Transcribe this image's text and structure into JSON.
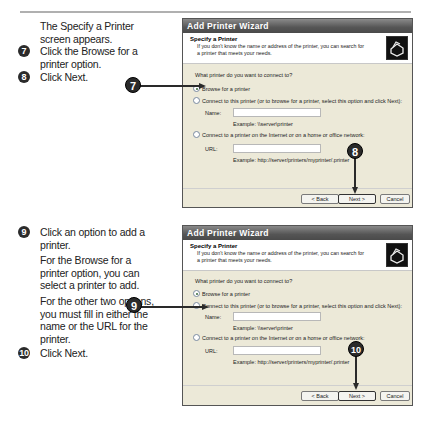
{
  "steps_top": {
    "intro": "The Specify a Printer screen appears.",
    "items": [
      {
        "num": "7",
        "text": "Click the Browse for a printer option."
      },
      {
        "num": "8",
        "text": "Click Next."
      }
    ]
  },
  "steps_bottom": {
    "items": [
      {
        "num": "9",
        "text": "Click an option to add a printer."
      },
      {
        "num": "",
        "text": "For the Browse for a printer option, you can select a printer to add."
      },
      {
        "num": "",
        "text": "For the other two options, you must fill in either the name or the URL for the printer."
      },
      {
        "num": "10",
        "text": "Click Next."
      }
    ]
  },
  "dialog": {
    "title": "Add Printer Wizard",
    "header_title": "Specify a Printer",
    "header_desc": "If you don't know the name or address of the printer, you can search for a printer that meets your needs.",
    "question": "What printer do you want to connect to?",
    "options": [
      "Browse for a printer",
      "Connect to this printer (or to browse for a printer, select this option and click Next):",
      "Connect to a printer on the Internet or on a home or office network:"
    ],
    "name_label": "Name:",
    "name_example": "Example: \\\\server\\printer",
    "url_label": "URL:",
    "url_example": "Example: http://server/printers/myprinter/.printer",
    "buttons": {
      "back": "< Back",
      "next": "Next >",
      "cancel": "Cancel"
    }
  },
  "callouts": [
    "7",
    "8",
    "9",
    "10"
  ],
  "icons": {
    "printer": "printer-icon"
  }
}
